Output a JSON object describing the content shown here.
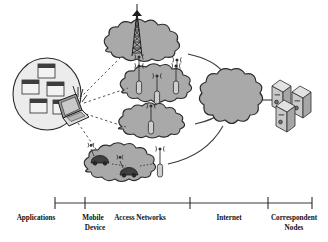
{
  "figure": {
    "type": "network-architecture-diagram",
    "background_color": "#ffffff",
    "cloud_fill": "#a9a9a9",
    "cloud_stroke": "#2b2b2b",
    "oval_fill": "#e8e8e8",
    "line_color": "#3a3a3a",
    "dashed_link_color": "#555555",
    "node_fill": "#d9d9d9",
    "dark_node_fill": "#4a4a4a"
  },
  "axis": {
    "name": "category-axis",
    "y": 203,
    "x_start": 55,
    "x_end": 312,
    "ticks": [
      55,
      85,
      190,
      268,
      312
    ],
    "labels": [
      {
        "id": "applications",
        "line1": "Applications",
        "line2": "",
        "x": 36,
        "y": 216
      },
      {
        "id": "mobile-device",
        "line1": "Mobile",
        "line2": "Device",
        "x": 93,
        "y": 216
      },
      {
        "id": "access-networks",
        "line1": "Access Networks",
        "line2": "",
        "x": 140,
        "y": 216
      },
      {
        "id": "internet",
        "line1": "Internet",
        "line2": "",
        "x": 229,
        "y": 216
      },
      {
        "id": "correspondent-nodes",
        "line1": "Correspondent",
        "line2": "Nodes",
        "x": 293,
        "y": 216
      }
    ]
  },
  "applications": {
    "oval": {
      "cx": 47,
      "cy": 94,
      "rx": 34,
      "ry": 36
    },
    "windows": [
      {
        "id": "app-window-1",
        "x": 38,
        "y": 64,
        "w": 17,
        "h": 14
      },
      {
        "id": "app-window-2",
        "x": 22,
        "y": 80,
        "w": 19,
        "h": 15
      },
      {
        "id": "app-window-3",
        "x": 47,
        "y": 82,
        "w": 17,
        "h": 14
      },
      {
        "id": "app-window-4",
        "x": 30,
        "y": 99,
        "w": 19,
        "h": 15
      },
      {
        "id": "app-window-5",
        "x": 53,
        "y": 100,
        "w": 16,
        "h": 13
      }
    ]
  },
  "mobile_device": {
    "id": "laptop",
    "label": "laptop with wireless antennas",
    "x": 55,
    "y": 96,
    "antennas": 4
  },
  "access_networks": [
    {
      "id": "cellular-macro-cloud",
      "cx": 146,
      "cy": 47,
      "rx": 46,
      "ry": 20,
      "elements": [
        "lattice-tower",
        "base-station-antenna",
        "base-station-antenna"
      ]
    },
    {
      "id": "wlan-cloud",
      "cx": 162,
      "cy": 88,
      "rx": 44,
      "ry": 19,
      "elements": [
        "base-station-antenna",
        "base-station-antenna",
        "base-station-antenna"
      ]
    },
    {
      "id": "wimax-cloud",
      "cx": 156,
      "cy": 125,
      "rx": 41,
      "ry": 17,
      "elements": [
        "base-station-antenna"
      ]
    },
    {
      "id": "vanet-cloud",
      "cx": 126,
      "cy": 167,
      "rx": 44,
      "ry": 19,
      "elements": [
        "vehicle",
        "vehicle",
        "base-station-antenna"
      ]
    }
  ],
  "internet": {
    "id": "internet-cloud",
    "cx": 231,
    "cy": 100,
    "r": 30
  },
  "correspondent_nodes": {
    "id": "server-cluster",
    "x": 272,
    "y": 84,
    "count": 3
  },
  "links": {
    "wireless_dashed": [
      {
        "from": "laptop",
        "to": "cellular-macro-cloud"
      },
      {
        "from": "laptop",
        "to": "wlan-cloud"
      },
      {
        "from": "laptop",
        "to": "wimax-cloud"
      },
      {
        "from": "laptop",
        "to": "vanet-cloud"
      }
    ],
    "wired_solid": [
      {
        "from": "cellular-macro-cloud",
        "to": "internet-cloud"
      },
      {
        "from": "wlan-cloud",
        "to": "internet-cloud"
      },
      {
        "from": "wimax-cloud",
        "to": "internet-cloud"
      },
      {
        "from": "vanet-cloud",
        "to": "internet-cloud"
      },
      {
        "from": "internet-cloud",
        "to": "server-cluster"
      }
    ]
  }
}
